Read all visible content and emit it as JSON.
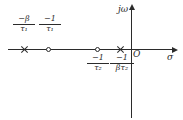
{
  "diagram": {
    "axes": {
      "horizontal_label": "σ",
      "vertical_label": "jω",
      "origin_label": "O"
    },
    "markers": [
      {
        "kind": "pole",
        "glyph": "x-marker",
        "label_numerator": "−β",
        "label_denominator": "τ₁",
        "label_plain": "-β/τ₁",
        "label_position": "above"
      },
      {
        "kind": "zero",
        "glyph": "o-marker",
        "label_numerator": "−1",
        "label_denominator": "τ₁",
        "label_plain": "-1/τ₁",
        "label_position": "above"
      },
      {
        "kind": "zero",
        "glyph": "o-marker",
        "label_numerator": "−1",
        "label_denominator": "τ₂",
        "label_plain": "-1/τ₂",
        "label_position": "below"
      },
      {
        "kind": "pole",
        "glyph": "x-marker",
        "label_numerator": "−1",
        "label_denominator": "βτ₂",
        "label_plain": "-1/βτ₂",
        "label_position": "below"
      }
    ],
    "colors": {
      "ink": "#2b2b2b",
      "background": "#ffffff"
    }
  }
}
